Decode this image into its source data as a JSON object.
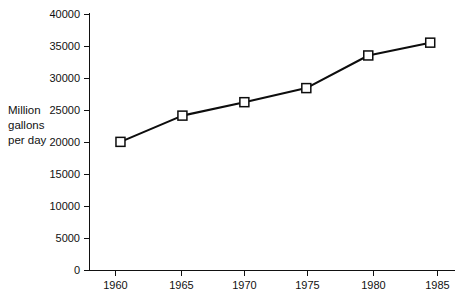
{
  "chart_data": {
    "type": "line",
    "title": "",
    "subtitle": "",
    "xlabel": "",
    "ylabel": "Million gallons per day",
    "ylabel_lines": [
      "Million",
      "gallons",
      "per day"
    ],
    "x": [
      1960,
      1965,
      1970,
      1975,
      1980,
      1985
    ],
    "categories": [
      "1960",
      "1965",
      "1970",
      "1975",
      "1980",
      "1985"
    ],
    "values": [
      20100,
      24200,
      26300,
      28500,
      33600,
      35600
    ],
    "series": [
      {
        "name": "Million gallons per day",
        "values": [
          20100,
          24200,
          26300,
          28500,
          33600,
          35600
        ]
      }
    ],
    "xlim": [
      1957.5,
      1987.0
    ],
    "ylim": [
      0,
      40000
    ],
    "ytick_labels": [
      "0",
      "5000",
      "10000",
      "15000",
      "20000",
      "25000",
      "30000",
      "35000",
      "40000"
    ],
    "ytick_values": [
      0,
      5000,
      10000,
      15000,
      20000,
      25000,
      30000,
      35000,
      40000
    ],
    "xtick_labels": [
      "1960",
      "1965",
      "1970",
      "1975",
      "1980",
      "1985"
    ],
    "xtick_values": [
      1960,
      1965,
      1970,
      1975,
      1980,
      1985
    ],
    "grid": false,
    "legend": false,
    "legend_position": "none",
    "marker": "square-open",
    "line_color": "#0d0d0d",
    "marker_face_color": "#ffffff",
    "marker_edge_color": "#0d0d0d",
    "background_color": "#ffffff",
    "annotations": []
  }
}
